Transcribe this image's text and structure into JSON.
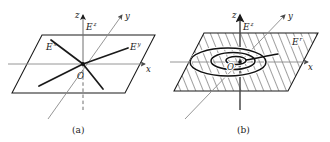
{
  "figure": {
    "type": "vector-field-diagram",
    "background": "#ffffff",
    "ink": "#1a1a1a",
    "axis_color": "#6e6e6e",
    "vector_color": "#1a1a1a",
    "hatch_color": "#2a2a2a",
    "panels": [
      {
        "id": "a",
        "caption": "(a)",
        "axes": [
          {
            "name": "z",
            "label": "z"
          },
          {
            "name": "y",
            "label": "y"
          },
          {
            "name": "x",
            "label": "x"
          }
        ],
        "origin_label": "O",
        "field_labels": [
          {
            "name": "E-z",
            "label": "E",
            "superscript": "z"
          },
          {
            "name": "E-x",
            "label": "E",
            "superscript": "x"
          },
          {
            "name": "E-y",
            "label": "E",
            "superscript": "y"
          }
        ],
        "plane_filled": false,
        "has_spiral": false
      },
      {
        "id": "b",
        "caption": "(b)",
        "axes": [
          {
            "name": "z",
            "label": "z"
          },
          {
            "name": "y",
            "label": "y"
          },
          {
            "name": "x",
            "label": "x"
          }
        ],
        "origin_label": "O",
        "field_labels": [
          {
            "name": "E-z",
            "label": "E",
            "superscript": "z"
          },
          {
            "name": "E-r",
            "label": "E",
            "superscript": "r"
          }
        ],
        "plane_filled": true,
        "plane_fill_style": "diagonal-hatch",
        "has_spiral": true
      }
    ]
  }
}
